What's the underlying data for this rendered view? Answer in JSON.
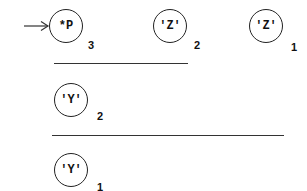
{
  "diagram": {
    "pointer": {
      "icon": "arrow-right-icon",
      "target": "node-p"
    },
    "rows": [
      {
        "nodes": [
          {
            "id": "node-p",
            "label": "*P",
            "index": "3"
          },
          {
            "id": "node-z2",
            "label": "'Z'",
            "index": "2"
          },
          {
            "id": "node-z1",
            "label": "'Z'",
            "index": "1"
          }
        ]
      },
      {
        "nodes": [
          {
            "id": "node-y2",
            "label": "'Y'",
            "index": "2"
          }
        ]
      },
      {
        "nodes": [
          {
            "id": "node-y1",
            "label": "'Y'",
            "index": "1"
          }
        ]
      }
    ],
    "colors": {
      "stroke": "#222222",
      "text": "#111111",
      "background": "#ffffff"
    }
  }
}
